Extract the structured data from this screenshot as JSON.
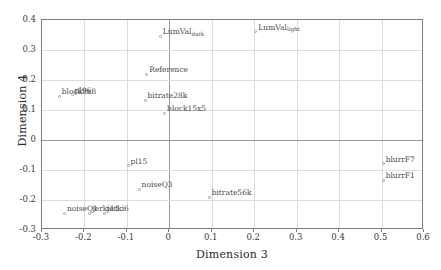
{
  "chart_data": {
    "type": "scatter",
    "title": "",
    "xlabel": "Dimension 3",
    "ylabel": "Dimension 4",
    "xlim": [
      -0.3,
      0.6
    ],
    "ylim": [
      -0.3,
      0.4
    ],
    "xticks": [
      "-0.3",
      "-0.2",
      "-0.1",
      "0",
      "0.1",
      "0.2",
      "0.3",
      "0.4",
      "0.5",
      "0.6"
    ],
    "xtick_values": [
      -0.3,
      -0.2,
      -0.1,
      0,
      0.1,
      0.2,
      0.3,
      0.4,
      0.5,
      0.6
    ],
    "yticks": [
      "0.4",
      "0.3",
      "0.2",
      "0.1",
      "0",
      "-0.1",
      "-0.2",
      "-0.3"
    ],
    "ytick_values": [
      0.4,
      0.3,
      0.2,
      0.1,
      0,
      -0.1,
      -0.2,
      -0.3
    ],
    "grid": true,
    "legend": "none",
    "marker_color": "#9b9b9b",
    "grid_color": "#dcdcdc",
    "axis_color": "#7d7d7d",
    "points": [
      {
        "label": "LumVal",
        "sub": "dark",
        "x": -0.02,
        "y": 0.345
      },
      {
        "label": "LumVal",
        "sub": "light",
        "x": 0.205,
        "y": 0.36
      },
      {
        "label": "Reference",
        "sub": "",
        "x": -0.052,
        "y": 0.218
      },
      {
        "label": "block8x8",
        "sub": "",
        "x": -0.258,
        "y": 0.144
      },
      {
        "label": "pl96",
        "sub": "",
        "x": -0.228,
        "y": 0.15
      },
      {
        "label": "bitrate28k",
        "sub": "",
        "x": -0.056,
        "y": 0.131
      },
      {
        "label": "block15x5",
        "sub": "",
        "x": -0.01,
        "y": 0.087
      },
      {
        "label": "pl15",
        "sub": "",
        "x": -0.096,
        "y": -0.088
      },
      {
        "label": "noiseQ3",
        "sub": "",
        "x": -0.07,
        "y": -0.166
      },
      {
        "label": "bitrate56k",
        "sub": "",
        "x": 0.095,
        "y": -0.192
      },
      {
        "label": "noiseQ1",
        "sub": "",
        "x": -0.246,
        "y": -0.245
      },
      {
        "label": "jerki11",
        "sub": "",
        "x": -0.186,
        "y": -0.245
      },
      {
        "label": "jerki6",
        "sub": "",
        "x": -0.152,
        "y": -0.245
      },
      {
        "label": "blurrF7",
        "sub": "",
        "x": 0.505,
        "y": -0.08
      },
      {
        "label": "blurrF1",
        "sub": "",
        "x": 0.505,
        "y": -0.136
      }
    ]
  }
}
